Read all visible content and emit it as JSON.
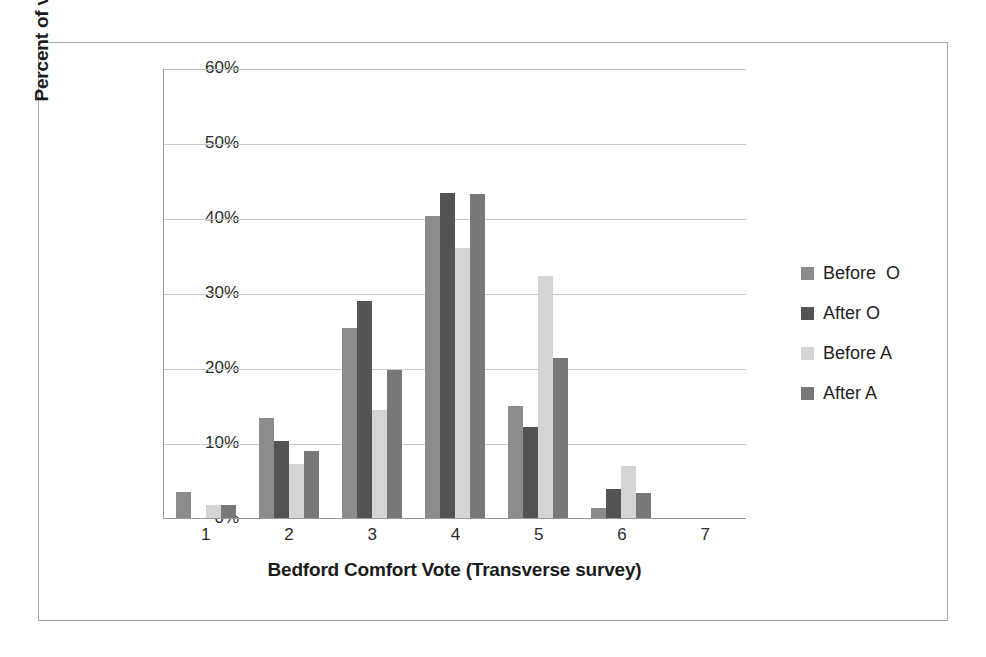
{
  "chart_data": {
    "type": "bar",
    "title": "",
    "xlabel": "Bedford Comfort Vote (Transverse survey)",
    "ylabel": "Percent of votes cast",
    "categories": [
      "1",
      "2",
      "3",
      "4",
      "5",
      "6",
      "7"
    ],
    "ylim": [
      0,
      60
    ],
    "yticks": [
      0,
      10,
      20,
      30,
      40,
      50,
      60
    ],
    "ytick_labels": [
      "0%",
      "10%",
      "20%",
      "30%",
      "40%",
      "50%",
      "60%"
    ],
    "grid": true,
    "legend_position": "right",
    "value_suffix": "%",
    "series": [
      {
        "name": "Before  O",
        "color": "#8c8c8c",
        "values": [
          3.5,
          13.4,
          25.3,
          40.3,
          15.0,
          1.3,
          0
        ]
      },
      {
        "name": "After O",
        "color": "#545454",
        "values": [
          0,
          10.3,
          29.0,
          43.4,
          12.1,
          3.9,
          0
        ]
      },
      {
        "name": "Before A",
        "color": "#d4d4d4",
        "values": [
          1.7,
          7.2,
          14.4,
          36.0,
          32.3,
          7.0,
          0
        ]
      },
      {
        "name": "After A",
        "color": "#787878",
        "values": [
          1.7,
          9.0,
          19.8,
          43.2,
          21.4,
          3.3,
          0
        ]
      }
    ]
  }
}
